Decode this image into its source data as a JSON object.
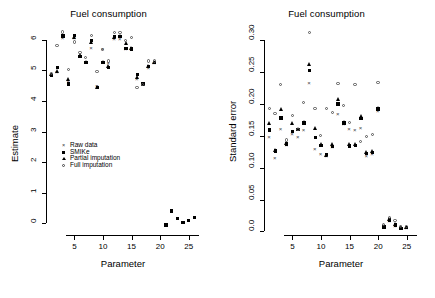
{
  "figure": {
    "width": 435,
    "height": 298,
    "background": "#ffffff",
    "foreground": "#000000"
  },
  "legend": {
    "position": "left-panel-center",
    "entries": [
      {
        "label": "Raw data",
        "marker": "cross-x-icon",
        "symbol": "×"
      },
      {
        "label": "SMIKe",
        "marker": "filled-square-icon",
        "symbol": "■"
      },
      {
        "label": "Partial imputation",
        "marker": "filled-triangle-icon",
        "symbol": "▲"
      },
      {
        "label": "Full imputation",
        "marker": "open-circle-icon",
        "symbol": "○"
      }
    ]
  },
  "chart_data": [
    {
      "type": "scatter",
      "panel": "left",
      "title": "Fuel consumption",
      "xlabel": "Parameter",
      "ylabel": "Estimate",
      "xlim": [
        0.2,
        26.8
      ],
      "ylim": [
        -0.35,
        6.45
      ],
      "xticks": [
        5,
        10,
        15,
        20,
        25
      ],
      "yticks": [
        0,
        1,
        2,
        3,
        4,
        5,
        6
      ],
      "ytick_labels": [
        "0",
        "1",
        "2",
        "3",
        "4",
        "5",
        "6"
      ],
      "grid": false,
      "legend_position": "center-left",
      "x": [
        1,
        2,
        3,
        4,
        5,
        6,
        7,
        8,
        9,
        10,
        11,
        12,
        13,
        14,
        15,
        16,
        17,
        18,
        19,
        21,
        22,
        23,
        24,
        25,
        26
      ],
      "series": [
        {
          "name": "Raw data",
          "marker": "×",
          "values": [
            4.86,
            4.93,
            6.05,
            4.6,
            6.05,
            5.45,
            5.25,
            5.72,
            4.47,
            5.68,
            5.22,
            6.02,
            6.02,
            5.7,
            5.7,
            4.72,
            4.55,
            5.08,
            5.22,
            null,
            null,
            null,
            null,
            null,
            null
          ]
        },
        {
          "name": "SMIKe",
          "marker": "■",
          "values": [
            4.84,
            5.1,
            6.12,
            4.55,
            6.14,
            5.46,
            5.25,
            5.98,
            4.43,
            5.25,
            5.1,
            6.1,
            6.1,
            5.72,
            5.7,
            4.86,
            4.58,
            5.12,
            5.25,
            -0.05,
            0.4,
            0.15,
            0.02,
            0.1,
            0.18
          ]
        },
        {
          "name": "Partial imputation",
          "marker": "▲",
          "values": [
            4.86,
            4.97,
            6.12,
            4.72,
            6.1,
            5.5,
            5.28,
            5.92,
            4.46,
            5.28,
            5.14,
            6.08,
            6.12,
            5.88,
            5.72,
            4.76,
            4.56,
            5.14,
            5.28,
            null,
            null,
            null,
            null,
            null,
            null
          ]
        },
        {
          "name": "Full imputation",
          "marker": "○",
          "values": [
            4.88,
            5.8,
            6.25,
            5.02,
            5.92,
            5.58,
            5.42,
            6.12,
            4.96,
            5.68,
            5.3,
            6.22,
            6.22,
            5.96,
            6.08,
            4.42,
            4.52,
            5.3,
            5.3,
            null,
            null,
            null,
            null,
            null,
            null
          ]
        }
      ]
    },
    {
      "type": "scatter",
      "panel": "right",
      "title": "Fuel consumption",
      "xlabel": "Parameter",
      "ylabel": "Standard error",
      "xlim": [
        0.2,
        26.8
      ],
      "ylim": [
        -0.004,
        0.322
      ],
      "xticks": [
        5,
        10,
        15,
        20,
        25
      ],
      "yticks": [
        0.0,
        0.05,
        0.1,
        0.15,
        0.2,
        0.25,
        0.3
      ],
      "ytick_labels": [
        "0.0",
        "0.05",
        "0.10",
        "0.15",
        "0.20",
        "0.25",
        "0.30"
      ],
      "grid": false,
      "legend_position": "none",
      "x": [
        1,
        2,
        3,
        4,
        5,
        6,
        7,
        8,
        9,
        10,
        11,
        12,
        13,
        14,
        15,
        16,
        17,
        18,
        19,
        20,
        21,
        22,
        23,
        24,
        25
      ],
      "series": [
        {
          "name": "Raw data",
          "marker": "×",
          "values": [
            0.148,
            0.115,
            0.16,
            0.135,
            0.152,
            0.148,
            0.158,
            0.232,
            0.128,
            0.121,
            0.118,
            0.131,
            0.184,
            0.168,
            0.16,
            0.158,
            0.162,
            0.118,
            0.12,
            0.188,
            0.006,
            0.015,
            0.008,
            0.004,
            0.005
          ]
        },
        {
          "name": "SMIKe",
          "marker": "■",
          "values": [
            0.159,
            0.126,
            0.178,
            0.137,
            0.157,
            0.16,
            0.17,
            0.252,
            0.147,
            0.135,
            0.121,
            0.133,
            0.2,
            0.17,
            0.134,
            0.135,
            0.177,
            0.122,
            0.124,
            0.192,
            0.007,
            0.018,
            0.01,
            0.005,
            0.006
          ]
        },
        {
          "name": "Partial imputation",
          "marker": "▲",
          "values": [
            0.17,
            0.128,
            0.192,
            0.138,
            0.17,
            0.16,
            0.172,
            0.262,
            0.162,
            0.136,
            0.12,
            0.137,
            0.208,
            0.172,
            0.136,
            0.137,
            0.18,
            0.124,
            0.126,
            0.193,
            0.008,
            0.019,
            0.011,
            0.006,
            0.007
          ]
        },
        {
          "name": "Full imputation",
          "marker": "○",
          "values": [
            0.193,
            0.185,
            0.23,
            0.143,
            0.182,
            0.159,
            0.202,
            0.312,
            0.193,
            0.15,
            0.192,
            0.186,
            0.231,
            0.197,
            0.17,
            0.23,
            0.141,
            0.148,
            0.152,
            0.233,
            0.01,
            0.021,
            0.017,
            0.007,
            0.008
          ]
        }
      ]
    }
  ]
}
